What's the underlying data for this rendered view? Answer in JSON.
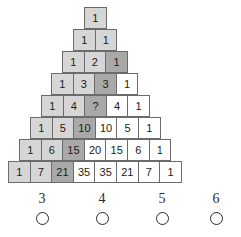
{
  "puzzle": {
    "type": "pascals-triangle-number-puzzle",
    "unknown_marker": "?",
    "rows": [
      {
        "index": 1,
        "left": 85,
        "top": 8,
        "cells": [
          {
            "value": "1",
            "shade": "light"
          }
        ]
      },
      {
        "index": 2,
        "left": 74,
        "top": 30,
        "cells": [
          {
            "value": "1",
            "shade": "light"
          },
          {
            "value": "1",
            "shade": "light"
          }
        ]
      },
      {
        "index": 3,
        "left": 63,
        "top": 52,
        "cells": [
          {
            "value": "1",
            "shade": "light"
          },
          {
            "value": "2",
            "shade": "light"
          },
          {
            "value": "1",
            "shade": "dark"
          }
        ]
      },
      {
        "index": 4,
        "left": 52,
        "top": 74,
        "cells": [
          {
            "value": "1",
            "shade": "light"
          },
          {
            "value": "3",
            "shade": "light"
          },
          {
            "value": "3",
            "shade": "dark"
          },
          {
            "value": "1",
            "shade": "white"
          }
        ]
      },
      {
        "index": 5,
        "left": 42,
        "top": 96,
        "cells": [
          {
            "value": "1",
            "shade": "light"
          },
          {
            "value": "4",
            "shade": "light"
          },
          {
            "value": "?",
            "shade": "q"
          },
          {
            "value": "4",
            "shade": "white"
          },
          {
            "value": "1",
            "shade": "white"
          }
        ]
      },
      {
        "index": 6,
        "left": 31,
        "top": 118,
        "cells": [
          {
            "value": "1",
            "shade": "light"
          },
          {
            "value": "5",
            "shade": "light"
          },
          {
            "value": "10",
            "shade": "dark"
          },
          {
            "value": "10",
            "shade": "white"
          },
          {
            "value": "5",
            "shade": "white"
          },
          {
            "value": "1",
            "shade": "white"
          }
        ]
      },
      {
        "index": 7,
        "left": 20,
        "top": 140,
        "cells": [
          {
            "value": "1",
            "shade": "light"
          },
          {
            "value": "6",
            "shade": "light"
          },
          {
            "value": "15",
            "shade": "dark"
          },
          {
            "value": "20",
            "shade": "white"
          },
          {
            "value": "15",
            "shade": "white"
          },
          {
            "value": "6",
            "shade": "white"
          },
          {
            "value": "1",
            "shade": "white"
          }
        ]
      },
      {
        "index": 8,
        "left": 9,
        "top": 162,
        "cells": [
          {
            "value": "1",
            "shade": "light"
          },
          {
            "value": "7",
            "shade": "light"
          },
          {
            "value": "21",
            "shade": "dark"
          },
          {
            "value": "35",
            "shade": "white"
          },
          {
            "value": "35",
            "shade": "white"
          },
          {
            "value": "21",
            "shade": "white"
          },
          {
            "value": "7",
            "shade": "white"
          },
          {
            "value": "1",
            "shade": "white"
          }
        ]
      }
    ]
  },
  "options": {
    "items": [
      {
        "label": "3",
        "left": 22,
        "selected": false
      },
      {
        "label": "4",
        "left": 82,
        "selected": false
      },
      {
        "label": "5",
        "left": 142,
        "selected": false
      },
      {
        "label": "6",
        "left": 196,
        "selected": false
      }
    ]
  },
  "colors": {
    "cell_border": "#6b6b6b",
    "cell_white": "#ffffff",
    "cell_light": "#d6d6d6",
    "cell_dark": "#a9a9a9",
    "text": "#1b1b1b",
    "option_text": "#2a2a2a",
    "background": "#ffffff"
  }
}
